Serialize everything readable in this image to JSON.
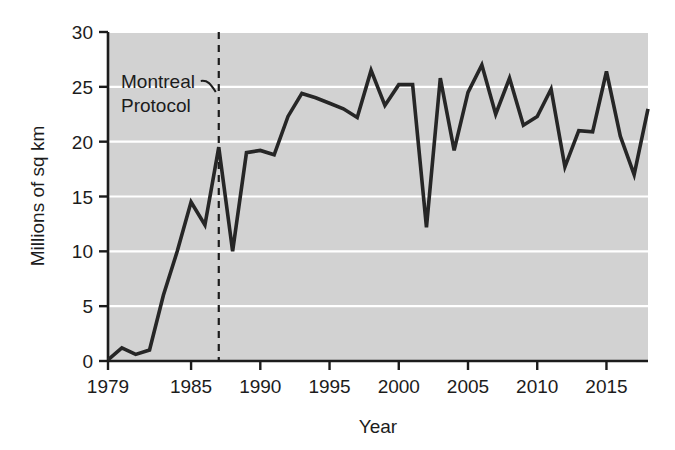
{
  "chart_data": {
    "type": "line",
    "title": "",
    "subtitle": "",
    "xlabel": "Year",
    "ylabel": "Millions of sq km",
    "xlim": [
      1979,
      2018
    ],
    "ylim": [
      0,
      30
    ],
    "grid": "horizontal-white",
    "legend": "none",
    "plot_background": "#d2d2d2",
    "line_color": "#262626",
    "x": [
      1979,
      1980,
      1981,
      1982,
      1983,
      1984,
      1985,
      1986,
      1987,
      1988,
      1989,
      1990,
      1991,
      1992,
      1993,
      1994,
      1995,
      1996,
      1997,
      1998,
      1999,
      2000,
      2001,
      2002,
      2003,
      2004,
      2005,
      2006,
      2007,
      2008,
      2009,
      2010,
      2011,
      2012,
      2013,
      2014,
      2015,
      2016,
      2017,
      2018
    ],
    "values": [
      0.1,
      1.2,
      0.6,
      1.0,
      6.0,
      10.0,
      14.5,
      12.4,
      19.5,
      10.0,
      19.0,
      19.2,
      18.8,
      22.3,
      24.4,
      24.0,
      23.5,
      23.0,
      22.2,
      26.5,
      23.3,
      25.2,
      25.2,
      12.2,
      25.8,
      19.2,
      24.5,
      27.0,
      22.5,
      25.8,
      21.5,
      22.3,
      24.8,
      17.7,
      21.0,
      20.9,
      26.4,
      20.5,
      17.0,
      23.0
    ],
    "xticks": [
      1979,
      1985,
      1990,
      1995,
      2000,
      2005,
      2010,
      2015
    ],
    "xtick_labels": [
      "1979",
      "1985",
      "1990",
      "1995",
      "2000",
      "2005",
      "2010",
      "2015"
    ],
    "yticks": [
      0,
      5,
      10,
      15,
      20,
      25,
      30
    ],
    "ytick_labels": [
      "0",
      "5",
      "10",
      "15",
      "20",
      "25",
      "30"
    ],
    "annotations": [
      {
        "name": "montreal-protocol",
        "line1": "Montreal",
        "line2": "Protocol",
        "x_value": 1987,
        "marker": "dashed-vertical-line"
      }
    ]
  }
}
